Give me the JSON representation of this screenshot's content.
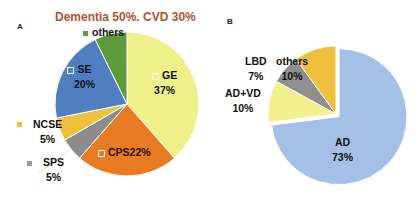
{
  "panels": {
    "a": {
      "label": "A",
      "title": "Dementia 50%. CVD 30%"
    },
    "b": {
      "label": "B"
    }
  },
  "chart_data": [
    {
      "type": "pie",
      "panel": "A",
      "title": "Dementia 50%. CVD 30%",
      "slices": [
        {
          "label": "GE",
          "value": 37,
          "value_label": "37%",
          "color": "#f0f08a"
        },
        {
          "label": "CPS",
          "value": 22,
          "value_label": "CPS22%",
          "color": "#e87a24"
        },
        {
          "label": "SPS",
          "value": 5,
          "value_label": "5%",
          "color": "#8c8c8c"
        },
        {
          "label": "NCSE",
          "value": 5,
          "value_label": "5%",
          "color": "#eec040"
        },
        {
          "label": "SE",
          "value": 20,
          "value_label": "20%",
          "color": "#4f7fc0"
        },
        {
          "label": "others",
          "value": 7,
          "value_label": "",
          "color": "#5e9a3a"
        }
      ]
    },
    {
      "type": "pie",
      "panel": "B",
      "title": "",
      "slices": [
        {
          "label": "AD",
          "value": 73,
          "value_label": "73%",
          "color": "#a5c0e6"
        },
        {
          "label": "AD+VD",
          "value": 10,
          "value_label": "10%",
          "color": "#f3f08e"
        },
        {
          "label": "LBD",
          "value": 7,
          "value_label": "7%",
          "color": "#8f8f8f"
        },
        {
          "label": "others",
          "value": 10,
          "value_label": "10%",
          "color": "#efbf3e"
        }
      ]
    }
  ],
  "labels": {
    "a_others": "others",
    "a_se": "SE",
    "a_se_pct": "20%",
    "a_ge": "GE",
    "a_ge_pct": "37%",
    "a_ncse": "NCSE",
    "a_ncse_pct": "5%",
    "a_sps": "SPS",
    "a_sps_pct": "5%",
    "a_cps": "CPS22%",
    "b_lbd": "LBD",
    "b_lbd_pct": "7%",
    "b_others": "others",
    "b_others_pct": "10%",
    "b_advd": "AD+VD",
    "b_advd_pct": "10%",
    "b_ad": "AD",
    "b_ad_pct": "73%"
  }
}
